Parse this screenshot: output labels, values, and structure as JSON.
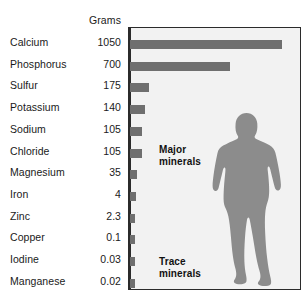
{
  "figure": {
    "column_header": "Grams",
    "value_unit": "Grams"
  },
  "captions": {
    "major": "Major\nminerals",
    "trace": "Trace\nminerals"
  },
  "colors": {
    "bar": "#6f6f6f",
    "panel_background": "#f2f2f2",
    "frame": "#2b2b2b",
    "silhouette": "#8c8c8c",
    "text": "#1a1a1a"
  },
  "chart_data": {
    "type": "bar",
    "orientation": "horizontal",
    "title": "",
    "xlabel": "",
    "ylabel": "",
    "value_label": "Grams",
    "categories": [
      "Calcium",
      "Phosphorus",
      "Sulfur",
      "Potassium",
      "Sodium",
      "Chloride",
      "Magnesium",
      "Iron",
      "Zinc",
      "Copper",
      "Iodine",
      "Manganese"
    ],
    "values": [
      1050,
      700,
      175,
      140,
      105,
      105,
      35,
      4,
      2.3,
      0.1,
      0.03,
      0.02
    ],
    "value_labels": [
      "1050",
      "700",
      "175",
      "140",
      "105",
      "105",
      "35",
      "4",
      "2.3",
      "0.1",
      "0.03",
      "0.02"
    ],
    "bar_pixel_lengths": [
      152,
      100,
      19,
      15,
      12,
      12,
      7,
      6,
      5,
      5,
      5,
      5
    ],
    "groups": [
      {
        "name": "Major minerals",
        "members": [
          "Calcium",
          "Phosphorus",
          "Sulfur",
          "Potassium",
          "Sodium",
          "Chloride",
          "Magnesium"
        ]
      },
      {
        "name": "Trace minerals",
        "members": [
          "Iron",
          "Zinc",
          "Copper",
          "Iodine",
          "Manganese"
        ]
      }
    ],
    "grid": false,
    "legend": "none",
    "annotations": [
      "Major minerals",
      "Trace minerals",
      "human body silhouette"
    ]
  }
}
